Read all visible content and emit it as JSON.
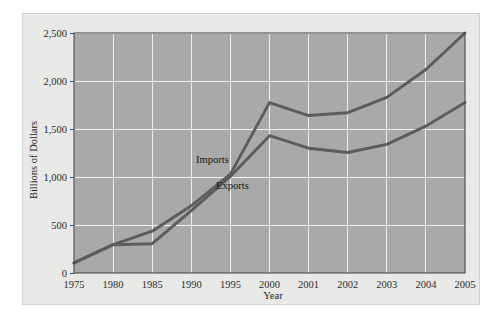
{
  "chart_data": {
    "type": "line",
    "title": "",
    "xlabel": "Year",
    "ylabel": "Billions of Dollars",
    "categories": [
      "1975",
      "1980",
      "1985",
      "1990",
      "1995",
      "2000",
      "2001",
      "2002",
      "2003",
      "2004",
      "2005"
    ],
    "x_tick_labels": [
      "1975",
      "1980",
      "1985",
      "1990",
      "1995",
      "2000",
      "2001",
      "2002",
      "2003",
      "2004",
      "2005"
    ],
    "y_tick_labels": [
      "0",
      "500",
      "1,000",
      "1,500",
      "2,000",
      "2,500"
    ],
    "y_tick_values": [
      0,
      500,
      1000,
      1500,
      2000,
      2500
    ],
    "ylim": [
      0,
      2500
    ],
    "grid": true,
    "legend_position": "inline-annotation",
    "series": [
      {
        "name": "Imports",
        "values": [
          105,
          295,
          435,
          700,
          1030,
          1775,
          1640,
          1670,
          1830,
          2120,
          2500
        ]
      },
      {
        "name": "Exports",
        "values": [
          105,
          295,
          305,
          650,
          1005,
          1430,
          1300,
          1255,
          1340,
          1530,
          1775
        ]
      }
    ],
    "annotations": [
      {
        "text": "Imports",
        "series": "Imports"
      },
      {
        "text": "Exports",
        "series": "Exports"
      }
    ],
    "colors": {
      "plot_background": "#a9a9a9",
      "card_background": "#e9e9e7",
      "gridline": "#f0f0ee",
      "series_line": "#5c5c5c",
      "frame": "#4a4a4a",
      "text": "#1d1d1d"
    }
  }
}
